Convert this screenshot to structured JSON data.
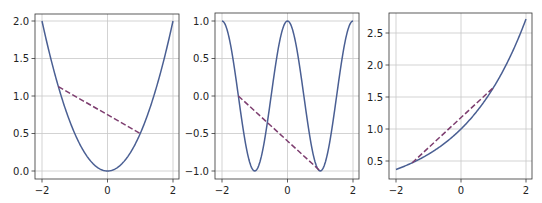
{
  "figure": {
    "width": 542,
    "height": 203,
    "background": "#ffffff",
    "curve_color": "#4a5f93",
    "secant_color": "#7d3d6f",
    "grid_color": "#c8c8c8",
    "frame_color": "#333333"
  },
  "chart_data": [
    {
      "type": "line",
      "title": "",
      "xlabel": "",
      "ylabel": "",
      "function": "y = x^2 / 2",
      "xlim": [
        -2,
        2
      ],
      "ylim": [
        -0.1,
        2.1
      ],
      "grid": true,
      "xticks": [
        -2,
        0,
        2
      ],
      "xtick_labels": [
        "−2",
        "0",
        "2"
      ],
      "yticks": [
        0.0,
        0.5,
        1.0,
        1.5,
        2.0
      ],
      "ytick_labels": [
        "0.0",
        "0.5",
        "1.0",
        "1.5",
        "2.0"
      ],
      "series": [
        {
          "name": "curve",
          "style": "solid",
          "x": [
            -2,
            -1.5,
            -1,
            -0.5,
            0,
            0.5,
            1,
            1.5,
            2
          ],
          "y": [
            2.0,
            1.125,
            0.5,
            0.125,
            0.0,
            0.125,
            0.5,
            1.125,
            2.0
          ]
        },
        {
          "name": "secant",
          "style": "dashed",
          "x": [
            -1.5,
            1.0
          ],
          "y": [
            1.125,
            0.5
          ]
        }
      ],
      "px": {
        "frame": [
          35,
          14,
          179,
          179
        ],
        "x0": 42,
        "x1": 173,
        "y_at_min_tick": 171,
        "y_at_max_tick": 21
      }
    },
    {
      "type": "line",
      "title": "",
      "xlabel": "",
      "ylabel": "",
      "function": "y = cos(pi x)",
      "xlim": [
        -2,
        2
      ],
      "ylim": [
        -1.1,
        1.1
      ],
      "grid": true,
      "xticks": [
        -2,
        0,
        2
      ],
      "xtick_labels": [
        "−2",
        "0",
        "2"
      ],
      "yticks": [
        -1.0,
        -0.5,
        0.0,
        0.5,
        1.0
      ],
      "ytick_labels": [
        "−1.0",
        "−0.5",
        "0.0",
        "0.5",
        "1.0"
      ],
      "series": [
        {
          "name": "curve",
          "style": "solid",
          "x": [
            -2,
            -1.5,
            -1,
            -0.5,
            0,
            0.5,
            1,
            1.5,
            2
          ],
          "y": [
            1.0,
            0.0,
            -1.0,
            0.0,
            1.0,
            0.0,
            -1.0,
            0.0,
            1.0
          ]
        },
        {
          "name": "secant",
          "style": "dashed",
          "x": [
            -1.5,
            1.0
          ],
          "y": [
            0.0,
            -1.0
          ]
        }
      ],
      "px": {
        "frame": [
          215,
          13,
          359,
          179
        ],
        "x0": 222,
        "x1": 353,
        "y_at_min_tick": 171,
        "y_at_max_tick": 21
      }
    },
    {
      "type": "line",
      "title": "",
      "xlabel": "",
      "ylabel": "",
      "function": "y = exp(x / 2)",
      "xlim": [
        -2,
        2
      ],
      "ylim": [
        0.25,
        2.85
      ],
      "grid": true,
      "xticks": [
        -2,
        0,
        2
      ],
      "xtick_labels": [
        "−2",
        "0",
        "2"
      ],
      "yticks": [
        0.5,
        1.0,
        1.5,
        2.0,
        2.5
      ],
      "ytick_labels": [
        "0.5",
        "1.0",
        "1.5",
        "2.0",
        "2.5"
      ],
      "series": [
        {
          "name": "curve",
          "style": "solid",
          "x": [
            -2,
            -1.5,
            -1,
            -0.5,
            0,
            0.5,
            1,
            1.5,
            2
          ],
          "y": [
            0.368,
            0.472,
            0.607,
            0.779,
            1.0,
            1.284,
            1.649,
            2.117,
            2.718
          ]
        },
        {
          "name": "secant",
          "style": "dashed",
          "x": [
            -1.5,
            1.0
          ],
          "y": [
            0.472,
            1.649
          ]
        }
      ],
      "px": {
        "frame": [
          389,
          13,
          532,
          179
        ],
        "x0": 396,
        "x1": 526,
        "y_at_min_tick": 161,
        "y_at_max_tick": 33
      }
    }
  ]
}
